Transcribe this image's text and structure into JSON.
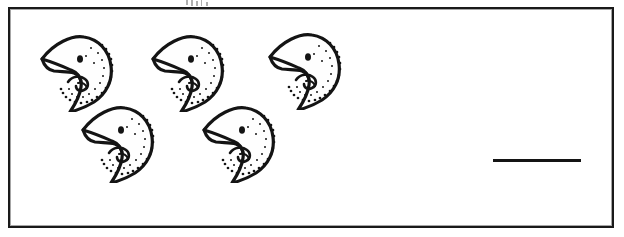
{
  "worksheet": {
    "title": "Counting exercise",
    "frame_label": "exercise-box",
    "object_name": "bird-head",
    "object_count": 5,
    "answer_line_label": "blank answer line",
    "answer_value": "",
    "ink_color": "#141414",
    "paper_color": "#ffffff",
    "fill_color": "#fefefe"
  },
  "objects": [
    {
      "id": 1,
      "name": "bird-head-1",
      "x": 34,
      "y": 26,
      "row": 1,
      "col": 1
    },
    {
      "id": 2,
      "name": "bird-head-2",
      "x": 145,
      "y": 26,
      "row": 1,
      "col": 2
    },
    {
      "id": 3,
      "name": "bird-head-3",
      "x": 262,
      "y": 24,
      "row": 1,
      "col": 3
    },
    {
      "id": 4,
      "name": "bird-head-4",
      "x": 75,
      "y": 97,
      "row": 2,
      "col": 1
    },
    {
      "id": 5,
      "name": "bird-head-5",
      "x": 196,
      "y": 97,
      "row": 2,
      "col": 2
    }
  ],
  "answer_area": {
    "line_x": 493,
    "line_y": 159,
    "line_width": 88,
    "value": ""
  },
  "artifacts": [
    {
      "x": 186,
      "y": 0,
      "w": 2,
      "h": 5
    },
    {
      "x": 191,
      "y": 0,
      "w": 2,
      "h": 6
    },
    {
      "x": 196,
      "y": 1,
      "w": 2,
      "h": 5
    },
    {
      "x": 201,
      "y": 0,
      "w": 1,
      "h": 6
    },
    {
      "x": 206,
      "y": 2,
      "w": 2,
      "h": 4
    }
  ]
}
